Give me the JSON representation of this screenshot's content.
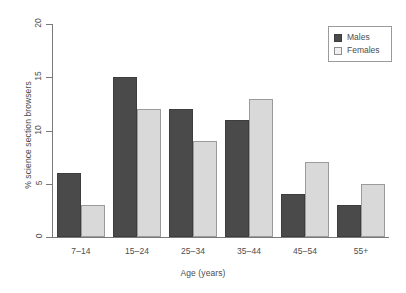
{
  "chart_data": {
    "type": "bar",
    "title": "",
    "xlabel": "Age (years)",
    "ylabel": "% science section browsers",
    "categories": [
      "7–14",
      "15–24",
      "25–34",
      "35–44",
      "45–54",
      "55+"
    ],
    "series": [
      {
        "name": "Males",
        "values": [
          6,
          15,
          12,
          11,
          4,
          3
        ],
        "color": "#4a4a4a"
      },
      {
        "name": "Females",
        "values": [
          3,
          12,
          9,
          13,
          7,
          5
        ],
        "color": "#d9d9d9"
      }
    ],
    "ylim": [
      0,
      20
    ],
    "yticks": [
      0,
      5,
      10,
      15,
      20
    ],
    "yticklabels": [
      "0",
      "5",
      "10",
      "15",
      "20"
    ],
    "grid": false,
    "legend": {
      "position": "top-right",
      "entries": [
        {
          "label": "Males",
          "swatch": "dark-square"
        },
        {
          "label": "Females",
          "swatch": "light-square"
        }
      ]
    }
  }
}
